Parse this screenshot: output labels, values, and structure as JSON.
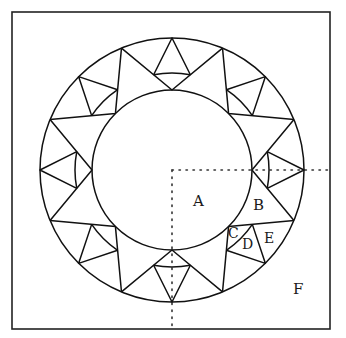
{
  "figure": {
    "frame": {
      "x": 12,
      "y": 12,
      "width": 318,
      "height": 317
    },
    "center": {
      "x": 172,
      "y": 170
    },
    "radii": {
      "outer": 132,
      "middle": 97,
      "inner": 80
    },
    "module_count": 8,
    "module_step_deg": 45,
    "small_triangle_halfangle_deg": 11,
    "outer_point_offset_deg": 22.5,
    "dotted_guides": {
      "horizontal": {
        "x1": 172,
        "y1": 170,
        "x2": 330,
        "y2": 170
      },
      "vertical": {
        "x1": 172,
        "y1": 170,
        "x2": 172,
        "y2": 326
      }
    },
    "labels": [
      {
        "id": "A",
        "text": "A",
        "x": 193,
        "y": 206,
        "region": "inner disk"
      },
      {
        "id": "B",
        "text": "B",
        "x": 253,
        "y": 210,
        "region": "large ring triangle"
      },
      {
        "id": "C",
        "text": "C",
        "x": 228,
        "y": 238,
        "region": "small curved triangle between inner point and middle arc"
      },
      {
        "id": "D",
        "text": "D",
        "x": 242,
        "y": 249,
        "region": "small triangle with apex on outer circle"
      },
      {
        "id": "E",
        "text": "E",
        "x": 264,
        "y": 243,
        "region": "side region between small triangle and outer circle"
      },
      {
        "id": "F",
        "text": "F",
        "x": 293,
        "y": 294,
        "region": "corner region outside the ring"
      }
    ],
    "colors": {
      "line": "#111111",
      "background": "#ffffff"
    }
  }
}
